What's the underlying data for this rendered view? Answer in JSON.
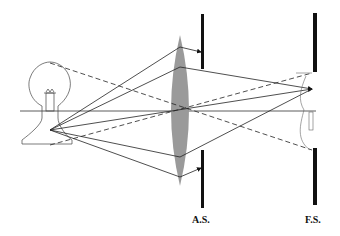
{
  "diagram": {
    "type": "optical-ray-diagram",
    "labels": {
      "aperture_stop": "A.S.",
      "field_stop": "F.S."
    },
    "elements": [
      {
        "name": "light-bulb",
        "role": "object"
      },
      {
        "name": "convex-lens",
        "role": "lens"
      },
      {
        "name": "aperture-stop",
        "label": "A.S."
      },
      {
        "name": "field-stop",
        "label": "F.S."
      },
      {
        "name": "inverted-bulb-image",
        "role": "image"
      }
    ],
    "colors": {
      "lens": "#9a9a9a",
      "stops": "#111111",
      "rays": "#222222"
    }
  }
}
